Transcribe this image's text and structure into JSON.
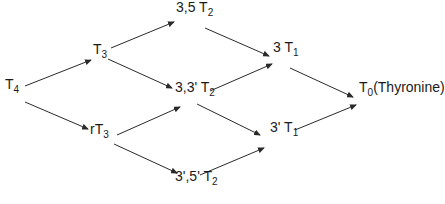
{
  "diagram": {
    "nodes": [
      {
        "id": "T4",
        "prefix": "",
        "base": "T",
        "sub": "4",
        "suffix": "",
        "x": 5,
        "y": 86
      },
      {
        "id": "T3",
        "prefix": "",
        "base": "T",
        "sub": "3",
        "suffix": "",
        "x": 93,
        "y": 51
      },
      {
        "id": "rT3",
        "prefix": "r",
        "base": "T",
        "sub": "3",
        "suffix": "",
        "x": 90,
        "y": 131
      },
      {
        "id": "3,5 T2",
        "prefix": "3,5 ",
        "base": "T",
        "sub": "2",
        "suffix": "",
        "x": 176,
        "y": 9
      },
      {
        "id": "3,3' T2",
        "prefix": "3,3' ",
        "base": "T",
        "sub": "2",
        "suffix": "",
        "x": 175,
        "y": 89
      },
      {
        "id": "3',5' T2",
        "prefix": "3',5' ",
        "base": "T",
        "sub": "2",
        "suffix": "",
        "x": 175,
        "y": 178
      },
      {
        "id": "3 T1",
        "prefix": "3 ",
        "base": "T",
        "sub": "1",
        "suffix": "",
        "x": 273,
        "y": 49
      },
      {
        "id": "3' T1",
        "prefix": "3' ",
        "base": "T",
        "sub": "1",
        "suffix": "",
        "x": 270,
        "y": 129
      },
      {
        "id": "T0",
        "prefix": "",
        "base": "T",
        "sub": "0",
        "suffix": "(Thyronine)",
        "x": 359,
        "y": 89
      }
    ],
    "edges": [
      {
        "from": "T4",
        "to": "T3",
        "x1": 25,
        "y1": 86,
        "x2": 91,
        "y2": 60
      },
      {
        "from": "T4",
        "to": "rT3",
        "x1": 25,
        "y1": 102,
        "x2": 88,
        "y2": 129
      },
      {
        "from": "T3",
        "to": "3,5 T2",
        "x1": 111,
        "y1": 48,
        "x2": 174,
        "y2": 22
      },
      {
        "from": "T3",
        "to": "3,3' T2",
        "x1": 108,
        "y1": 59,
        "x2": 172,
        "y2": 88
      },
      {
        "from": "rT3",
        "to": "3,3' T2",
        "x1": 117,
        "y1": 135,
        "x2": 180,
        "y2": 107
      },
      {
        "from": "rT3",
        "to": "3',5' T2",
        "x1": 114,
        "y1": 144,
        "x2": 177,
        "y2": 173
      },
      {
        "from": "3,5 T2",
        "to": "3 T1",
        "x1": 205,
        "y1": 28,
        "x2": 269,
        "y2": 56
      },
      {
        "from": "3,3' T2",
        "to": "3 T1",
        "x1": 210,
        "y1": 91,
        "x2": 272,
        "y2": 64
      },
      {
        "from": "3,3' T2",
        "to": "3' T1",
        "x1": 197,
        "y1": 104,
        "x2": 260,
        "y2": 135
      },
      {
        "from": "3',5' T2",
        "to": "3' T1",
        "x1": 200,
        "y1": 175,
        "x2": 264,
        "y2": 148
      },
      {
        "from": "3 T1",
        "to": "T0",
        "x1": 290,
        "y1": 68,
        "x2": 353,
        "y2": 97
      },
      {
        "from": "3' T1",
        "to": "T0",
        "x1": 295,
        "y1": 130,
        "x2": 356,
        "y2": 105
      }
    ],
    "colors": {
      "line": "#2a2a2a",
      "text": "#1a1a1a",
      "background": "#ffffff"
    }
  }
}
